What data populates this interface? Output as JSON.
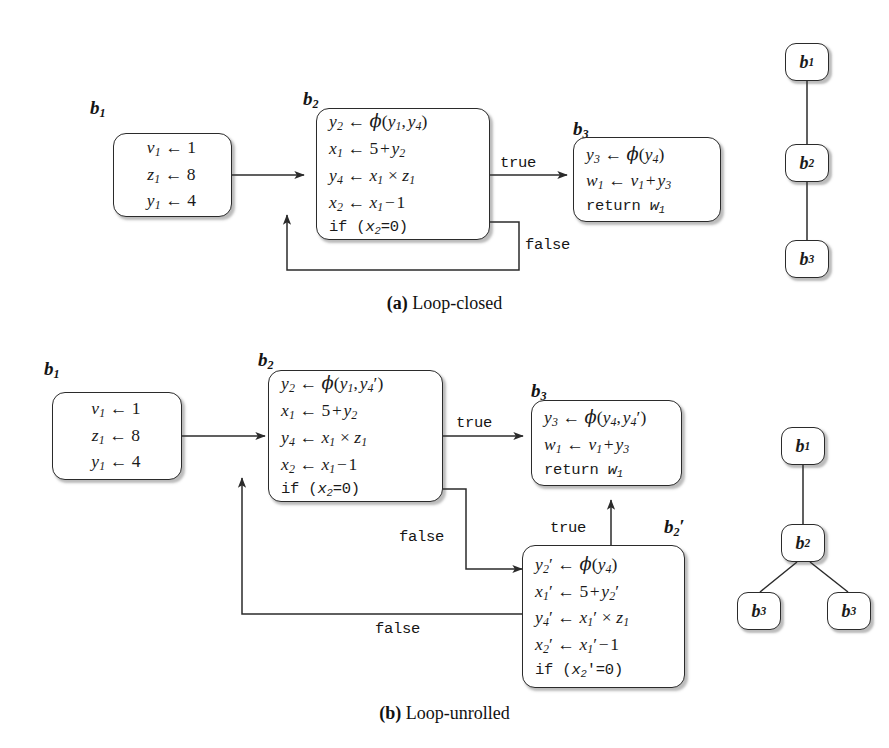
{
  "figure": {
    "line_color": "#2b2b2b",
    "background": "#ffffff"
  },
  "panels": [
    {
      "id": "a",
      "caption_label": "(a)",
      "caption_text": "Loop-closed",
      "blocks": [
        {
          "tag": "b1",
          "tag_label": "b",
          "tag_sub": "1",
          "statements": [
            {
              "text": "v1 ← 1",
              "style": "math"
            },
            {
              "text": "z1 ← 8",
              "style": "math"
            },
            {
              "text": "y1 ← 4",
              "style": "math"
            }
          ]
        },
        {
          "tag": "b2",
          "tag_label": "b",
          "tag_sub": "2",
          "statements": [
            {
              "text": "y2 ← φ(y1, y4)",
              "style": "math"
            },
            {
              "text": "x1 ← 5 + y2",
              "style": "math"
            },
            {
              "text": "y4 ← x1 × z1",
              "style": "math"
            },
            {
              "text": "x2 ← x1 − 1",
              "style": "math"
            },
            {
              "text": "if (x2 = 0)",
              "style": "mono"
            }
          ]
        },
        {
          "tag": "b3",
          "tag_label": "b",
          "tag_sub": "3",
          "statements": [
            {
              "text": "y3 ← φ(y4)",
              "style": "math"
            },
            {
              "text": "w1 ← v1 + y3",
              "style": "math"
            },
            {
              "text": "return w1",
              "style": "mono"
            }
          ]
        }
      ],
      "edge_labels": [
        "true",
        "false"
      ],
      "tree": {
        "nodes": [
          "b1",
          "b2",
          "b3"
        ],
        "edges": [
          [
            "b1",
            "b2"
          ],
          [
            "b2",
            "b3"
          ]
        ]
      }
    },
    {
      "id": "b",
      "caption_label": "(b)",
      "caption_text": "Loop-unrolled",
      "blocks": [
        {
          "tag": "b1",
          "tag_label": "b",
          "tag_sub": "1",
          "statements": [
            {
              "text": "v1 ← 1",
              "style": "math"
            },
            {
              "text": "z1 ← 8",
              "style": "math"
            },
            {
              "text": "y1 ← 4",
              "style": "math"
            }
          ]
        },
        {
          "tag": "b2",
          "tag_label": "b",
          "tag_sub": "2",
          "statements": [
            {
              "text": "y2 ← φ(y1, y4′)",
              "style": "math"
            },
            {
              "text": "x1 ← 5 + y2",
              "style": "math"
            },
            {
              "text": "y4 ← x1 × z1",
              "style": "math"
            },
            {
              "text": "x2 ← x1 − 1",
              "style": "math"
            },
            {
              "text": "if (x2 = 0)",
              "style": "mono"
            }
          ]
        },
        {
          "tag": "b3",
          "tag_label": "b",
          "tag_sub": "3",
          "statements": [
            {
              "text": "y3 ← φ(y4, y4′)",
              "style": "math"
            },
            {
              "text": "w1 ← v1 + y3",
              "style": "math"
            },
            {
              "text": "return w1",
              "style": "mono"
            }
          ]
        },
        {
          "tag": "b2p",
          "tag_label": "b",
          "tag_sub": "2",
          "tag_prime": "′",
          "statements": [
            {
              "text": "y2′ ← φ(y4)",
              "style": "math"
            },
            {
              "text": "x1′ ← 5 + y2′",
              "style": "math"
            },
            {
              "text": "y4′ ← x1′ × z1",
              "style": "math"
            },
            {
              "text": "x2′ ← x1′ − 1",
              "style": "math"
            },
            {
              "text": "if (x2′ = 0)",
              "style": "mono"
            }
          ]
        }
      ],
      "edge_labels": [
        "true",
        "false",
        "true",
        "false"
      ],
      "tree": {
        "nodes": [
          "b1",
          "b2",
          "b3",
          "b3"
        ],
        "edges": [
          [
            "b1",
            "b2"
          ],
          [
            "b2",
            "b3-left"
          ],
          [
            "b2",
            "b3-right"
          ]
        ]
      }
    }
  ],
  "labels": {
    "true": "true",
    "false": "false",
    "b": "b",
    "sub1": "1",
    "sub2": "2",
    "sub3": "3",
    "sub4": "4",
    "prime": "′",
    "phi": "φ",
    "assign": "←",
    "times": "×",
    "minus": "−",
    "plus": "+",
    "eq": "=",
    "zero": "0",
    "one": "1",
    "four": "4",
    "five": "5",
    "eight": "8",
    "if": "if",
    "return": "return",
    "v": "v",
    "w": "w",
    "x": "x",
    "y": "y",
    "z": "z",
    "lparen": "(",
    "rparen": ")",
    "comma": ","
  },
  "captions": {
    "a_label": "(a)",
    "a_text": "Loop-closed",
    "b_label": "(b)",
    "b_text": "Loop-unrolled"
  }
}
